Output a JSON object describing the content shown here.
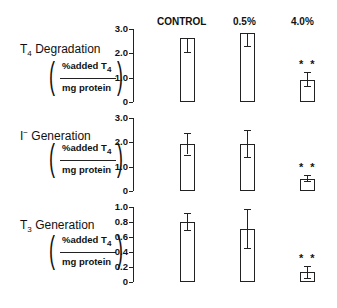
{
  "columns": [
    "CONTROL",
    "0.5%",
    "4.0%"
  ],
  "panels": [
    {
      "title_main": "T",
      "title_sub": "4",
      "title_rest": " Degradation",
      "unit_numerator": "%added T",
      "unit_numerator_sub": "4",
      "unit_denominator": "mg protein",
      "ticks": [
        "3.0",
        "2.0",
        "1.0",
        "0"
      ],
      "significance": "* *"
    },
    {
      "title_main": "I",
      "title_sub": "−",
      "title_rest": " Generation",
      "unit_numerator": "%added T",
      "unit_numerator_sub": "4",
      "unit_denominator": "mg protein",
      "ticks": [
        "3.0",
        "2.0",
        "1.0",
        "0"
      ],
      "significance": "* *"
    },
    {
      "title_main": "T",
      "title_sub": "3",
      "title_rest": " Generation",
      "unit_numerator": "%added T",
      "unit_numerator_sub": "4",
      "unit_denominator": "mg protein",
      "ticks": [
        "1.0",
        "0.8",
        "0.6",
        "0.4",
        "0.2",
        "0"
      ],
      "significance": "* *"
    }
  ],
  "chart_data": [
    {
      "type": "bar",
      "title": "T4 Degradation",
      "ylabel": "%added T4 / mg protein",
      "categories": [
        "CONTROL",
        "0.5%",
        "4.0%"
      ],
      "values": [
        2.65,
        2.85,
        0.9
      ],
      "error_low": [
        2.05,
        2.3,
        0.65
      ],
      "error_high": [
        2.65,
        2.85,
        1.25
      ],
      "significance": [
        "",
        "",
        "**"
      ],
      "ylim": [
        0,
        3.0
      ],
      "yticks": [
        0,
        1.0,
        2.0,
        3.0
      ],
      "grid": false
    },
    {
      "type": "bar",
      "title": "I− Generation",
      "ylabel": "%added T4 / mg protein",
      "categories": [
        "CONTROL",
        "0.5%",
        "4.0%"
      ],
      "values": [
        1.92,
        1.95,
        0.5
      ],
      "error_low": [
        1.5,
        1.4,
        0.4
      ],
      "error_high": [
        2.37,
        2.5,
        0.65
      ],
      "significance": [
        "",
        "",
        "**"
      ],
      "ylim": [
        0,
        3.0
      ],
      "yticks": [
        0,
        1.0,
        2.0,
        3.0
      ],
      "grid": false
    },
    {
      "type": "bar",
      "title": "T3 Generation",
      "ylabel": "%added T4 / mg protein",
      "categories": [
        "CONTROL",
        "0.5%",
        "4.0%"
      ],
      "values": [
        0.8,
        0.71,
        0.13
      ],
      "error_low": [
        0.7,
        0.46,
        0.06
      ],
      "error_high": [
        0.92,
        0.97,
        0.22
      ],
      "significance": [
        "",
        "",
        "**"
      ],
      "ylim": [
        0,
        1.0
      ],
      "yticks": [
        0,
        0.2,
        0.4,
        0.6,
        0.8,
        1.0
      ],
      "grid": false
    }
  ]
}
